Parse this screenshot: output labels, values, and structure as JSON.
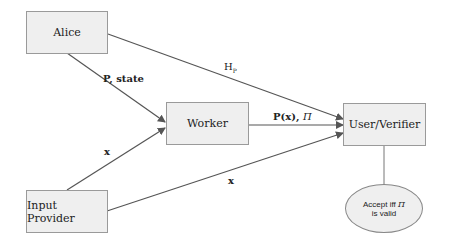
{
  "nodes": {
    "alice": "Alice",
    "worker": "Worker",
    "verifier": "User/Verifier",
    "input_provider": "Input Provider"
  },
  "edges": {
    "alice_to_worker": "P, state",
    "alice_to_verifier_main": "H",
    "alice_to_verifier_sub": "P",
    "worker_to_verifier_main": "P(x), ",
    "worker_to_verifier_pi": "Π",
    "input_to_worker": "x",
    "input_to_verifier": "x"
  },
  "decision": {
    "line1_main": "Accept iff ",
    "line1_pi": "Π",
    "line2": "is valid"
  },
  "colors": {
    "box_fill": "#efefef",
    "box_border": "#9a9a9a",
    "line": "#555555"
  }
}
